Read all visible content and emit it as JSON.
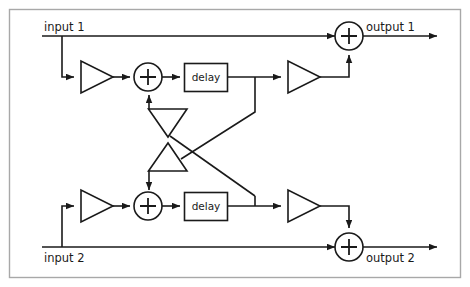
{
  "diagram": {
    "frame": {
      "stroke": "#a8a8a8"
    },
    "line_color": "#1a1a1a",
    "background": "#ffffff",
    "labels": {
      "input_1": "input 1",
      "input_2": "input 2",
      "output_1": "output 1",
      "output_2": "output 2",
      "delay_top": "delay",
      "delay_bottom": "delay"
    },
    "blocks": [
      {
        "name": "delay-block-top",
        "type": "delay",
        "label": "delay",
        "channel": "1"
      },
      {
        "name": "delay-block-bottom",
        "type": "delay",
        "label": "delay",
        "channel": "2"
      },
      {
        "name": "adder-top-feedback",
        "type": "adder",
        "symbol": "+",
        "channel": "1"
      },
      {
        "name": "adder-bottom-feedback",
        "type": "adder",
        "symbol": "+",
        "channel": "2"
      },
      {
        "name": "adder-output-1",
        "type": "adder",
        "symbol": "+",
        "channel": "1"
      },
      {
        "name": "adder-output-2",
        "type": "adder",
        "symbol": "+",
        "channel": "2"
      },
      {
        "name": "gain-input-1",
        "type": "amplifier",
        "direction": "right",
        "channel": "1"
      },
      {
        "name": "gain-input-2",
        "type": "amplifier",
        "direction": "right",
        "channel": "2"
      },
      {
        "name": "gain-output-1",
        "type": "amplifier",
        "direction": "right",
        "channel": "1"
      },
      {
        "name": "gain-output-2",
        "type": "amplifier",
        "direction": "right",
        "channel": "2"
      },
      {
        "name": "gain-feedback-cross-top",
        "type": "amplifier",
        "direction": "down",
        "channel": "cross"
      },
      {
        "name": "gain-feedback-cross-bottom",
        "type": "amplifier",
        "direction": "up",
        "channel": "cross"
      }
    ],
    "signal_paths": [
      {
        "name": "input-1-direct-to-output-1",
        "from": "input 1",
        "to": "adder-output-1"
      },
      {
        "name": "input-1-branch-to-gain",
        "from": "input 1",
        "to": "gain-input-1"
      },
      {
        "name": "delay-top-to-gain-output-1",
        "from": "delay-block-top",
        "to": "gain-output-1"
      },
      {
        "name": "delay-top-cross-to-gain-cross-bottom",
        "from": "delay-block-top",
        "to": "gain-feedback-cross-bottom"
      },
      {
        "name": "delay-bottom-cross-to-gain-cross-top",
        "from": "delay-block-bottom",
        "to": "gain-feedback-cross-top"
      },
      {
        "name": "input-2-direct-to-output-2",
        "from": "input 2",
        "to": "adder-output-2"
      },
      {
        "name": "input-2-branch-to-gain",
        "from": "input 2",
        "to": "gain-input-2"
      },
      {
        "name": "delay-bottom-to-gain-output-2",
        "from": "delay-block-bottom",
        "to": "gain-output-2"
      }
    ]
  }
}
